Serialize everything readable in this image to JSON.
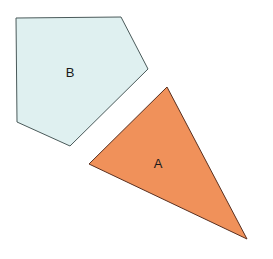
{
  "diagram": {
    "shapes": [
      {
        "id": "pentagon-b",
        "label": "B",
        "type": "pentagon",
        "fill": "#dff0f0",
        "stroke": "#4a5a5a",
        "points": "16,18 121,17 148,69 70,146 17,122",
        "label_x": 70,
        "label_y": 77
      },
      {
        "id": "triangle-a",
        "label": "A",
        "type": "triangle",
        "fill": "#f0915a",
        "stroke": "#5a3020",
        "points": "167,87 247,239 89,164",
        "label_x": 158,
        "label_y": 168
      }
    ]
  }
}
